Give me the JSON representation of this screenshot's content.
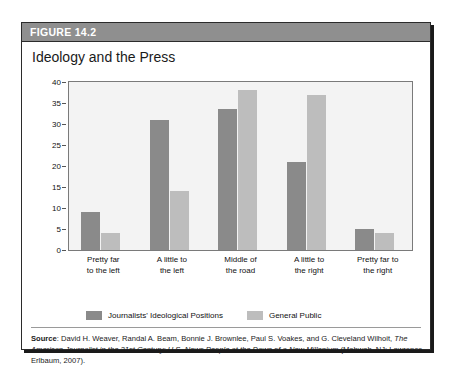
{
  "figure": {
    "banner_label": "FIGURE 14.2",
    "title": "Ideology and the Press"
  },
  "legend": {
    "items": [
      {
        "label": "Journalists' Ideological Positions",
        "color": "#8a8a8a"
      },
      {
        "label": "General Public",
        "color": "#bdbdbd"
      }
    ]
  },
  "source": {
    "label": "Source",
    "separator": ": ",
    "authors": "David H. Weaver, Randal A. Beam, Bonnie J. Brownlee, Paul S. Voakes, and G. Cleveland Wilhoit, ",
    "title_italic": "The American Journalist in the 21st Century: U.S. News People at the Dawn of a New Millenium",
    "publication": " (Mahwah, NJ: Lawrence Erlbaum, 2007)."
  },
  "chart_data": {
    "type": "bar",
    "title": "Ideology and the Press",
    "xlabel": "",
    "ylabel": "",
    "ylim": [
      0,
      40
    ],
    "yticks": [
      0,
      5,
      10,
      15,
      20,
      25,
      30,
      35,
      40
    ],
    "grid": false,
    "legend_position": "bottom",
    "categories": [
      "Pretty far to the left",
      "A little to the left",
      "Middle of the road",
      "A little to the right",
      "Pretty far to the right"
    ],
    "category_lines": [
      [
        "Pretty far",
        "to the left"
      ],
      [
        "A little to",
        "the left"
      ],
      [
        "Middle of",
        "the road"
      ],
      [
        "A little to",
        "the right"
      ],
      [
        "Pretty far to",
        "the right"
      ]
    ],
    "series": [
      {
        "name": "Journalists' Ideological Positions",
        "color": "#8a8a8a",
        "values": [
          9,
          31,
          33.5,
          21,
          5
        ]
      },
      {
        "name": "General Public",
        "color": "#bdbdbd",
        "values": [
          4,
          14,
          38,
          37,
          4
        ]
      }
    ]
  }
}
